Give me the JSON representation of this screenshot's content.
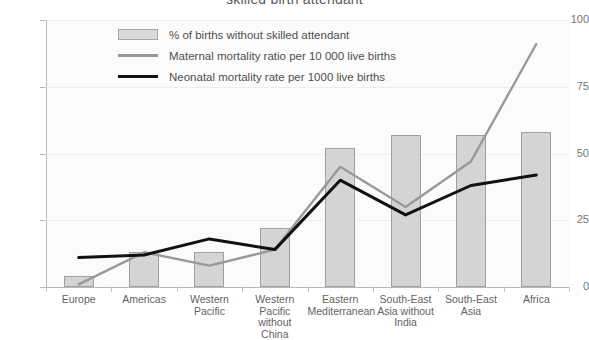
{
  "chart_data": {
    "type": "bar",
    "title": "skilled birth attendant",
    "xlabel": "",
    "ylabel": "",
    "ylim": [
      0,
      100
    ],
    "yticks": [
      0,
      25,
      50,
      75,
      100
    ],
    "grid": false,
    "legend_position": "top-left-inside",
    "categories": [
      "Europe",
      "Americas",
      "Western Pacific",
      "Western Pacific without China",
      "Eastern Mediterranean",
      "South-East Asia without India",
      "South-East Asia",
      "Africa"
    ],
    "category_lines": [
      [
        "Europe"
      ],
      [
        "Americas"
      ],
      [
        "Western",
        "Pacific"
      ],
      [
        "Western",
        "Pacific without",
        "China"
      ],
      [
        "Eastern",
        "Mediterranean"
      ],
      [
        "South-East",
        "Asia without",
        "India"
      ],
      [
        "South-East",
        "Asia"
      ],
      [
        "Africa"
      ]
    ],
    "series": [
      {
        "name": "% of births without skilled attendant",
        "kind": "bar",
        "color": "#d4d4d4",
        "values": [
          4,
          13,
          13,
          22,
          52,
          57,
          57,
          58
        ]
      },
      {
        "name": "Maternal mortality ratio per 10 000 live births",
        "kind": "line",
        "color": "#999999",
        "values": [
          1,
          13,
          8,
          14,
          45,
          30,
          47,
          91
        ]
      },
      {
        "name": "Neonatal mortality rate per 1000 live births",
        "kind": "line",
        "color": "#111111",
        "values": [
          11,
          12,
          18,
          14,
          40,
          27,
          38,
          42
        ]
      }
    ]
  },
  "legend": {
    "items": [
      {
        "label": "% of births without skilled attendant",
        "swatch": "bar-swatch"
      },
      {
        "label": "Maternal mortality ratio per 10 000 live births",
        "swatch": "gray-line-swatch"
      },
      {
        "label": "Neonatal mortality rate per 1000 live births",
        "swatch": "black-line-swatch"
      }
    ]
  },
  "axis": {
    "y_tick_labels": [
      "100",
      "75",
      "50",
      "25",
      "0"
    ]
  }
}
